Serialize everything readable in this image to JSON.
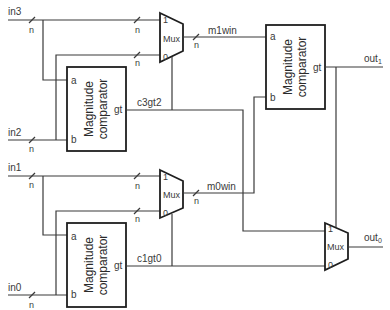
{
  "diagram": {
    "inputs": [
      "in3",
      "in2",
      "in1",
      "in0"
    ],
    "outputs": {
      "out1": {
        "base": "out",
        "sub": "1"
      },
      "out0": {
        "base": "out",
        "sub": "0"
      }
    },
    "bus_width_label": "n",
    "mux": {
      "label": "Mux",
      "port1": "1",
      "port0": "0"
    },
    "comparator": {
      "line1": "Magnitude",
      "line2": "comparator",
      "port_a": "a",
      "port_b": "b",
      "port_gt": "gt"
    },
    "signals": {
      "c3gt2": "c3gt2",
      "c1gt0": "c1gt0",
      "m1win": "m1win",
      "m0win": "m0win"
    }
  }
}
